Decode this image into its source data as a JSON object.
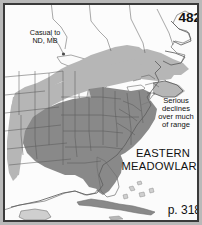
{
  "figure": {
    "kind": "field-guide-range-map",
    "plate_number": "482",
    "page_reference": "p. 318",
    "species_name_line1": "EASTERN",
    "species_name_line2": "MEADOWLARK",
    "annotations": {
      "casual_note_line1": "Casual to",
      "casual_note_line2": "ND, MB",
      "decline_note_line1": "Serious",
      "decline_note_line2": "declines",
      "decline_note_line3": "over much",
      "decline_note_line4": "of range"
    },
    "colors": {
      "frame": "#3a3a3a",
      "page_background": "#b9b9b9",
      "land_background": "#fbfbfb",
      "water": "#fbfbfb",
      "coastline": "#6f6f6f",
      "state_border": "#555555",
      "range_summer": "#b4b4b4",
      "range_resident": "#8a8a8a",
      "text": "#111111"
    },
    "map_extent": {
      "region": "eastern North America",
      "north": "Hudson Bay / Quebec",
      "south": "Cuba / Caribbean",
      "west": "Great Plains",
      "east": "Atlantic Ocean"
    }
  }
}
